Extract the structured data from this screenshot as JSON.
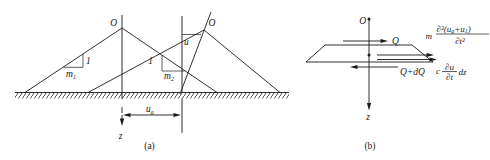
{
  "colors": {
    "ink": "#1a1a1a",
    "background": "#ffffff"
  },
  "panel_a": {
    "caption": "(a)",
    "origin_left": "O",
    "origin_right": "O",
    "slope_left": {
      "unit": "1",
      "base": "m",
      "sub": "1"
    },
    "slope_right": {
      "unit": "1",
      "base": "m",
      "sub": "2"
    },
    "crest_displacement": "u",
    "ground_displacement": {
      "base": "u",
      "sub": "g"
    },
    "axis_label": "z"
  },
  "panel_b": {
    "caption": "(b)",
    "origin": "O",
    "axis_label": "z",
    "shear_top": "Q",
    "shear_bottom": "Q+dQ",
    "inertia_force": {
      "coef": "m",
      "num_a": "∂²(u",
      "num_sub1": "g",
      "num_b": "+u",
      "num_sub2": "1",
      "num_c": ")",
      "den": "∂t²"
    },
    "damping_force": {
      "coef": "c",
      "num": "∂u",
      "den": "∂t",
      "suffix": "dz"
    }
  }
}
